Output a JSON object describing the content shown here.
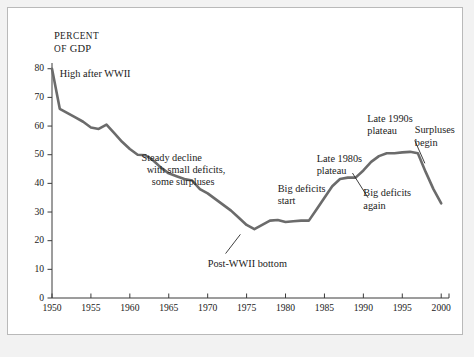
{
  "figure": {
    "axis_title_line1": "Percent",
    "axis_title_line2": "of GDP",
    "line_color": "#6b6b6b",
    "axis_color": "#3a3a3a",
    "text_color": "#1b1b1b",
    "background": "#ffffff",
    "border_color": "#b9b9b9",
    "page_background": "#f2f2f2",
    "caption_fragment": ""
  },
  "chart_data": {
    "type": "line",
    "title": "",
    "xlabel": "",
    "ylabel": "Percent of GDP",
    "xlim": [
      1950,
      2001
    ],
    "ylim": [
      0,
      82
    ],
    "xticks": [
      1950,
      1955,
      1960,
      1965,
      1970,
      1975,
      1980,
      1985,
      1990,
      1995,
      2000
    ],
    "xticklabels": [
      "1950",
      "1955",
      "1960",
      "1965",
      "1970",
      "1975",
      "1980",
      "1985",
      "1990",
      "1995",
      "2000"
    ],
    "yticks": [
      0,
      10,
      20,
      30,
      40,
      50,
      60,
      70,
      80
    ],
    "yticklabels": [
      "0",
      "10",
      "20",
      "30",
      "40",
      "50",
      "60",
      "70",
      "80"
    ],
    "grid": false,
    "legend": false,
    "series": [
      {
        "name": "Federal debt held by the public",
        "x": [
          1950,
          1951,
          1952,
          1953,
          1954,
          1955,
          1956,
          1957,
          1958,
          1959,
          1960,
          1961,
          1962,
          1963,
          1964,
          1965,
          1966,
          1967,
          1968,
          1969,
          1970,
          1971,
          1972,
          1973,
          1974,
          1975,
          1976,
          1977,
          1978,
          1979,
          1980,
          1981,
          1982,
          1983,
          1984,
          1985,
          1986,
          1987,
          1988,
          1989,
          1990,
          1991,
          1992,
          1993,
          1994,
          1995,
          1996,
          1997,
          1998,
          1999,
          2000
        ],
        "values": [
          80.0,
          66.0,
          64.5,
          63.0,
          61.5,
          59.5,
          59.0,
          60.5,
          57.5,
          54.5,
          52.0,
          50.0,
          49.8,
          48.0,
          45.5,
          43.5,
          42.5,
          41.5,
          41.0,
          38.0,
          36.5,
          34.5,
          32.5,
          30.5,
          28.0,
          25.5,
          24.0,
          25.5,
          27.0,
          27.2,
          26.5,
          26.8,
          27.0,
          27.0,
          31.0,
          35.0,
          39.0,
          41.5,
          42.0,
          42.0,
          44.5,
          47.5,
          49.5,
          50.5,
          50.5,
          50.8,
          51.0,
          50.5,
          44.0,
          38.0,
          33.0
        ]
      }
    ],
    "annotations": [
      {
        "id": "high-after-wwii",
        "text": "High after WWII",
        "x": 1951.0,
        "y": 78.0,
        "leader": false
      },
      {
        "id": "steady-decline",
        "text": "Steady decline\n  with small deficits,\n    some surpluses",
        "x": 1961.5,
        "y": 49.0,
        "leader": false
      },
      {
        "id": "post-wwii-bottom",
        "text": "Post-WWII bottom",
        "x": 1970.0,
        "y": 12.0,
        "leader": true
      },
      {
        "id": "big-deficits-start",
        "text": "Big deficits\nstart",
        "x": 1979.0,
        "y": 38.0,
        "leader": false
      },
      {
        "id": "late-1980s-plateau",
        "text": "Late 1980s\nplateau",
        "x": 1984.0,
        "y": 48.5,
        "leader": false
      },
      {
        "id": "late-1990s-plateau",
        "text": "Late 1990s\nplateau",
        "x": 1990.5,
        "y": 62.5,
        "leader": false
      },
      {
        "id": "big-deficits-again",
        "text": "Big deficits\nagain",
        "x": 1990.0,
        "y": 36.5,
        "leader": true
      },
      {
        "id": "surpluses-begin",
        "text": "Surpluses\nbegin",
        "x": 1996.6,
        "y": 58.5,
        "leader": true
      }
    ]
  }
}
